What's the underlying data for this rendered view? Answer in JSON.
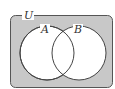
{
  "diagram": {
    "type": "venn",
    "universe_label": "U",
    "sets": [
      {
        "label": "A"
      },
      {
        "label": "B"
      }
    ],
    "shaded_region": "complement of A ∪ B",
    "colors": {
      "shade": "#c8c8c8",
      "stroke": "#444444",
      "background": "#ffffff"
    }
  }
}
